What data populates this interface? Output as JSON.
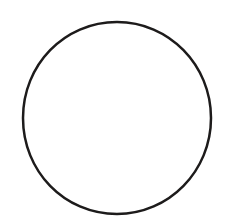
{
  "canvas": {
    "width": 230,
    "height": 221,
    "background_color": "#ffffff",
    "description": "Plain white canvas containing a single hand-drawn circle outline"
  },
  "figure": {
    "name": "circle-outline",
    "shape_type": "circle",
    "fill": "none",
    "fill_color": "#ffffff",
    "stroke_color": "#1d1b1b",
    "stroke_width": 2.5,
    "style": "hand-drawn",
    "center_x": 117,
    "center_y": 118,
    "radius_x": 94,
    "radius_y": 96,
    "bounds": {
      "left": 23,
      "top": 22,
      "right": 211,
      "bottom": 214
    },
    "path": "M 117 22 C 169 22 211 65 211 118 C 211 171 169 214 117 214 C 64 214 23 171 23 118 C 23 65 64 22 117 22 Z"
  },
  "labels": {
    "figure_caption": ""
  }
}
